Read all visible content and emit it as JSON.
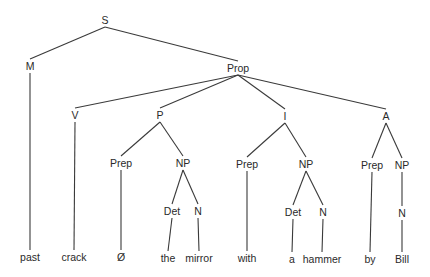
{
  "diagram": {
    "type": "syntax-tree",
    "nodes": [
      {
        "id": "S",
        "label": "S",
        "x": 105,
        "y": 20
      },
      {
        "id": "M",
        "label": "M",
        "x": 30,
        "y": 66
      },
      {
        "id": "Prop",
        "label": "Prop",
        "x": 238,
        "y": 68
      },
      {
        "id": "V",
        "label": "V",
        "x": 75,
        "y": 115
      },
      {
        "id": "P",
        "label": "P",
        "x": 160,
        "y": 115
      },
      {
        "id": "I",
        "label": "I",
        "x": 285,
        "y": 116
      },
      {
        "id": "A",
        "label": "A",
        "x": 386,
        "y": 116
      },
      {
        "id": "Prep1",
        "label": "Prep",
        "x": 121,
        "y": 163
      },
      {
        "id": "NP1",
        "label": "NP",
        "x": 183,
        "y": 163
      },
      {
        "id": "Prep2",
        "label": "Prep",
        "x": 247,
        "y": 164
      },
      {
        "id": "NP2",
        "label": "NP",
        "x": 306,
        "y": 164
      },
      {
        "id": "Prep3",
        "label": "Prep",
        "x": 372,
        "y": 165
      },
      {
        "id": "NP3",
        "label": "NP",
        "x": 402,
        "y": 165
      },
      {
        "id": "Det1",
        "label": "Det",
        "x": 172,
        "y": 211
      },
      {
        "id": "N1",
        "label": "N",
        "x": 198,
        "y": 211
      },
      {
        "id": "Det2",
        "label": "Det",
        "x": 293,
        "y": 212
      },
      {
        "id": "N2",
        "label": "N",
        "x": 323,
        "y": 212
      },
      {
        "id": "N3",
        "label": "N",
        "x": 402,
        "y": 213
      },
      {
        "id": "w_past",
        "label": "past",
        "x": 30,
        "y": 257,
        "leaf": true
      },
      {
        "id": "w_crack",
        "label": "crack",
        "x": 74,
        "y": 257,
        "leaf": true
      },
      {
        "id": "w_null",
        "label": "Ø",
        "x": 121,
        "y": 257,
        "leaf": true
      },
      {
        "id": "w_the",
        "label": "the",
        "x": 168,
        "y": 258,
        "leaf": true
      },
      {
        "id": "w_mirror",
        "label": "mirror",
        "x": 199,
        "y": 258,
        "leaf": true
      },
      {
        "id": "w_with",
        "label": "with",
        "x": 247,
        "y": 258,
        "leaf": true
      },
      {
        "id": "w_a",
        "label": "a",
        "x": 292,
        "y": 259,
        "leaf": true
      },
      {
        "id": "w_hammer",
        "label": "hammer",
        "x": 322,
        "y": 259,
        "leaf": true
      },
      {
        "id": "w_by",
        "label": "by",
        "x": 370,
        "y": 259,
        "leaf": true
      },
      {
        "id": "w_Bill",
        "label": "Bill",
        "x": 402,
        "y": 259,
        "leaf": true
      }
    ],
    "edges": [
      [
        "S",
        "M"
      ],
      [
        "S",
        "Prop"
      ],
      [
        "M",
        "w_past"
      ],
      [
        "Prop",
        "V"
      ],
      [
        "Prop",
        "P"
      ],
      [
        "Prop",
        "I"
      ],
      [
        "Prop",
        "A"
      ],
      [
        "V",
        "w_crack"
      ],
      [
        "P",
        "Prep1"
      ],
      [
        "P",
        "NP1"
      ],
      [
        "Prep1",
        "w_null"
      ],
      [
        "NP1",
        "Det1"
      ],
      [
        "NP1",
        "N1"
      ],
      [
        "Det1",
        "w_the"
      ],
      [
        "N1",
        "w_mirror"
      ],
      [
        "I",
        "Prep2"
      ],
      [
        "I",
        "NP2"
      ],
      [
        "Prep2",
        "w_with"
      ],
      [
        "NP2",
        "Det2"
      ],
      [
        "NP2",
        "N2"
      ],
      [
        "Det2",
        "w_a"
      ],
      [
        "N2",
        "w_hammer"
      ],
      [
        "A",
        "Prep3"
      ],
      [
        "A",
        "NP3"
      ],
      [
        "Prep3",
        "w_by"
      ],
      [
        "NP3",
        "N3"
      ],
      [
        "N3",
        "w_Bill"
      ]
    ]
  }
}
